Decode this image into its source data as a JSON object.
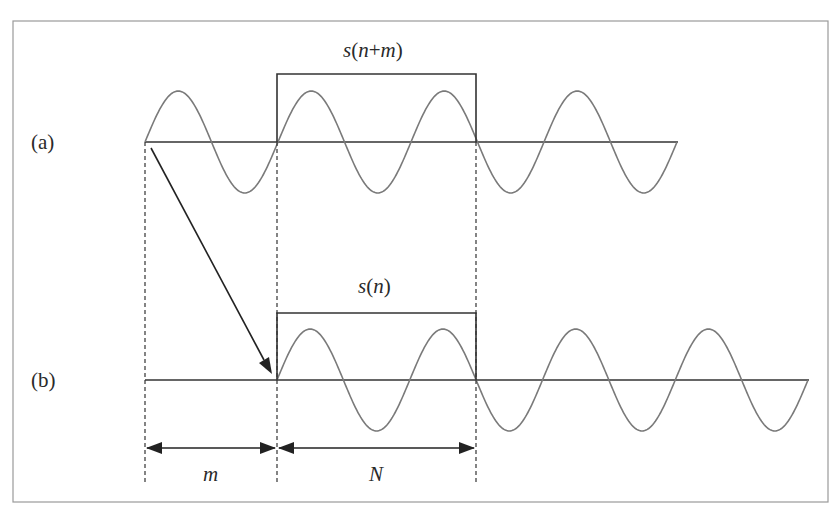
{
  "figure": {
    "colors": {
      "frame": "#9a9a9a",
      "axis": "#333333",
      "wave": "#7a7a7a",
      "window": "#333333",
      "arrow": "#222222",
      "text": "#2a2a2a"
    },
    "row_a": {
      "label": "(a)",
      "window_label": "s(n+m)",
      "window_label_parts": {
        "s": "s",
        "open": "(",
        "n": "n",
        "plus": "+",
        "m": "m",
        "close": ")"
      },
      "periods": 4
    },
    "row_b": {
      "label": "(b)",
      "window_label": "s(n)",
      "window_label_parts": {
        "s": "s",
        "open": "(",
        "n": "n",
        "close": ")"
      },
      "periods": 4
    },
    "dimensions": {
      "shift_label": "m",
      "window_length_label": "N"
    }
  }
}
